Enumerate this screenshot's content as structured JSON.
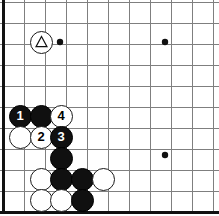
{
  "figure": {
    "kind": "go-board-diagram",
    "title": "",
    "width": 219,
    "height": 216,
    "background_color": "#ffffff"
  },
  "board": {
    "grid_spacing": 21,
    "origin_x": 3,
    "origin_y": 0,
    "columns": 11,
    "rows": 11,
    "line_color": "#7f7f7f",
    "edge_color": "#111111",
    "edge_width": 3,
    "line_width": 1,
    "star_point_color": "#101010",
    "star_point_radius": 3.2,
    "star_points": [
      {
        "x": 60,
        "y": 42
      },
      {
        "x": 165,
        "y": 42
      },
      {
        "x": 165,
        "y": 155
      }
    ],
    "edges": {
      "left": true,
      "bottom": true,
      "top": false,
      "right": false
    }
  },
  "stones": [
    {
      "id": "white-marked",
      "color": "white",
      "x": 41,
      "y": 42,
      "label": "",
      "marker": "triangle"
    },
    {
      "id": "black-1",
      "color": "black",
      "x": 20,
      "y": 116,
      "label": "1",
      "marker": ""
    },
    {
      "id": "black-a",
      "color": "black",
      "x": 41,
      "y": 116,
      "label": "",
      "marker": ""
    },
    {
      "id": "white-4",
      "color": "white",
      "x": 61,
      "y": 116,
      "label": "4",
      "marker": ""
    },
    {
      "id": "white-b",
      "color": "white",
      "x": 20,
      "y": 137,
      "label": "",
      "marker": ""
    },
    {
      "id": "white-2",
      "color": "white",
      "x": 41,
      "y": 137,
      "label": "2",
      "marker": ""
    },
    {
      "id": "black-3",
      "color": "black",
      "x": 61,
      "y": 137,
      "label": "3",
      "marker": ""
    },
    {
      "id": "black-c",
      "color": "black",
      "x": 61,
      "y": 158,
      "label": "",
      "marker": ""
    },
    {
      "id": "white-d",
      "color": "white",
      "x": 41,
      "y": 179,
      "label": "",
      "marker": ""
    },
    {
      "id": "black-e",
      "color": "black",
      "x": 61,
      "y": 179,
      "label": "",
      "marker": ""
    },
    {
      "id": "black-f",
      "color": "black",
      "x": 82,
      "y": 179,
      "label": "",
      "marker": ""
    },
    {
      "id": "white-g",
      "color": "white",
      "x": 103,
      "y": 179,
      "label": "",
      "marker": ""
    },
    {
      "id": "white-h",
      "color": "white",
      "x": 41,
      "y": 200,
      "label": "",
      "marker": ""
    },
    {
      "id": "white-i",
      "color": "white",
      "x": 61,
      "y": 200,
      "label": "",
      "marker": ""
    },
    {
      "id": "black-j",
      "color": "black",
      "x": 82,
      "y": 200,
      "label": "",
      "marker": ""
    }
  ],
  "stone_radius": 11.5,
  "move_sequence": [
    "1",
    "2",
    "3",
    "4"
  ]
}
